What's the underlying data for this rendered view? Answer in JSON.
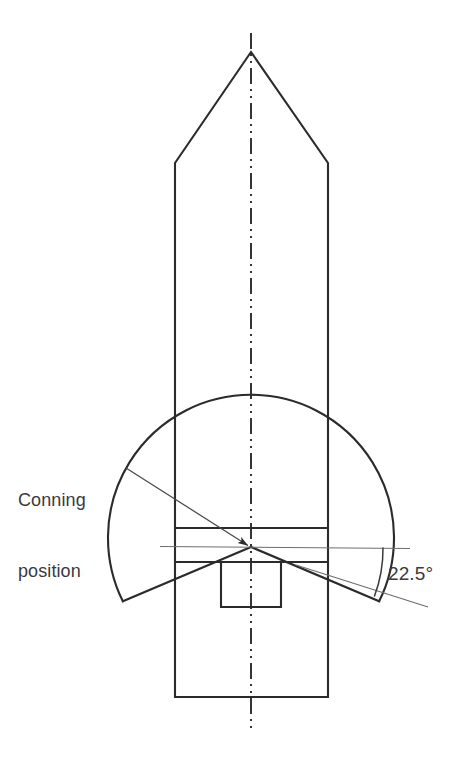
{
  "diagram": {
    "labels": {
      "conning_position_line1": "Conning",
      "conning_position_line2": "position",
      "angle": "22.5°"
    },
    "colors": {
      "background": "#ffffff",
      "outline": "#2b2b2d",
      "thin_line": "#6d6d70",
      "text": "#3a3a3c"
    },
    "geometry": {
      "centerline_x": 251,
      "conning_position": {
        "x": 251,
        "y": 547
      },
      "arc_radius": 143,
      "arc_half_angle_deg": 22.5,
      "bow_apex": {
        "x": 251,
        "y": 52
      },
      "hull_shoulder_y": 163,
      "hull_left_x": 175,
      "hull_right_x": 328,
      "stern_y": 697,
      "bridge_deck_top_y": 528,
      "bridge_deck_mid_y": 547,
      "bridge_deck_bottom_y": 562,
      "deckhouse": {
        "left": 221,
        "right": 281,
        "top": 562,
        "bottom": 607
      },
      "sight_line_x1": 160,
      "sight_line_x2": 410,
      "leader_start": {
        "x": 126,
        "y": 468
      },
      "arc_left_end": {
        "x": 122,
        "y": 601
      },
      "arc_right_end": {
        "x": 383,
        "y": 598
      }
    }
  }
}
